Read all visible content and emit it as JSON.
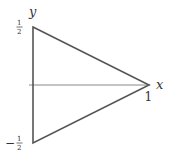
{
  "diagram": {
    "type": "triangle-on-axes",
    "axes": {
      "x_label": "x",
      "y_label": "y"
    },
    "vertices": [
      {
        "name": "top",
        "x": 0,
        "y": 0.5
      },
      {
        "name": "right",
        "x": 1,
        "y": 0
      },
      {
        "name": "bottom",
        "x": 0,
        "y": -0.5
      }
    ],
    "tick_labels": {
      "y_top_num": "1",
      "y_top_den": "2",
      "y_bottom_sign": "−",
      "y_bottom_num": "1",
      "y_bottom_den": "2",
      "x_one": "1"
    },
    "colors": {
      "stroke": "#555555",
      "axis": "#777777",
      "text": "#333333"
    }
  }
}
